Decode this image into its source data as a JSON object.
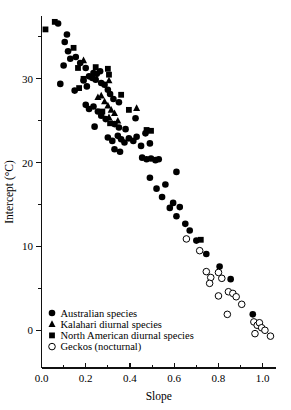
{
  "chart_data": {
    "type": "scatter",
    "title": "",
    "xlabel": "Slope",
    "ylabel": "Intercept (°C)",
    "xlim": [
      0.0,
      1.06
    ],
    "ylim": [
      -4.5,
      37.5
    ],
    "grid": false,
    "legend_position": "lower-left-inside",
    "x_ticks_major": [
      0.0,
      0.2,
      0.4,
      0.6,
      0.8,
      1.0
    ],
    "x_tick_labels": [
      "0.0",
      "0.2",
      "0.4",
      "0.6",
      "0.8",
      "1.0"
    ],
    "x_ticks_minor": [
      0.1,
      0.3,
      0.5,
      0.7,
      0.9
    ],
    "y_ticks_major": [
      0,
      10,
      20,
      30
    ],
    "y_tick_labels": [
      "0",
      "10",
      "20",
      "30"
    ],
    "y_ticks_minor": [
      5,
      15,
      25,
      35
    ],
    "series": [
      {
        "name": "Australian species",
        "marker": "filled-circle",
        "color": "#000000",
        "points": [
          [
            0.075,
            36.6
          ],
          [
            0.115,
            35.3
          ],
          [
            0.105,
            34.4
          ],
          [
            0.12,
            33.3
          ],
          [
            0.13,
            32.4
          ],
          [
            0.1,
            31.6
          ],
          [
            0.155,
            32.6
          ],
          [
            0.175,
            31.9
          ],
          [
            0.2,
            31.3
          ],
          [
            0.085,
            29.4
          ],
          [
            0.215,
            30.3
          ],
          [
            0.23,
            30.1
          ],
          [
            0.245,
            29.9
          ],
          [
            0.25,
            30.6
          ],
          [
            0.27,
            29.5
          ],
          [
            0.285,
            29.3
          ],
          [
            0.15,
            28.6
          ],
          [
            0.3,
            28.7
          ],
          [
            0.265,
            30.9
          ],
          [
            0.235,
            30.7
          ],
          [
            0.205,
            29.1
          ],
          [
            0.19,
            29.8
          ],
          [
            0.31,
            28.2
          ],
          [
            0.325,
            27.6
          ],
          [
            0.2,
            26.9
          ],
          [
            0.215,
            26.4
          ],
          [
            0.235,
            26.7
          ],
          [
            0.255,
            26.1
          ],
          [
            0.27,
            25.6
          ],
          [
            0.29,
            25.2
          ],
          [
            0.24,
            24.3
          ],
          [
            0.33,
            24.6
          ],
          [
            0.35,
            24.2
          ],
          [
            0.38,
            24.0
          ],
          [
            0.3,
            23.0
          ],
          [
            0.32,
            22.6
          ],
          [
            0.345,
            23.2
          ],
          [
            0.36,
            22.8
          ],
          [
            0.375,
            22.4
          ],
          [
            0.395,
            22.9
          ],
          [
            0.415,
            22.6
          ],
          [
            0.43,
            23.1
          ],
          [
            0.45,
            22.0
          ],
          [
            0.47,
            23.5
          ],
          [
            0.49,
            22.3
          ],
          [
            0.33,
            21.6
          ],
          [
            0.355,
            21.3
          ],
          [
            0.455,
            20.6
          ],
          [
            0.475,
            20.4
          ],
          [
            0.495,
            20.5
          ],
          [
            0.515,
            20.3
          ],
          [
            0.53,
            20.4
          ],
          [
            0.49,
            18.2
          ],
          [
            0.52,
            16.9
          ],
          [
            0.545,
            15.9
          ],
          [
            0.56,
            17.4
          ],
          [
            0.58,
            14.6
          ],
          [
            0.595,
            15.2
          ],
          [
            0.61,
            13.6
          ],
          [
            0.625,
            14.7
          ],
          [
            0.65,
            12.7
          ],
          [
            0.67,
            11.9
          ],
          [
            0.7,
            10.7
          ],
          [
            0.745,
            9.1
          ],
          [
            0.805,
            7.6
          ],
          [
            0.855,
            6.1
          ],
          [
            0.955,
            1.9
          ],
          [
            0.35,
            27.2
          ],
          [
            0.425,
            25.3
          ],
          [
            0.61,
            18.9
          ]
        ]
      },
      {
        "name": "Kalahari diurnal species",
        "marker": "filled-triangle",
        "color": "#000000",
        "points": [
          [
            0.19,
            32.2
          ],
          [
            0.305,
            29.8
          ],
          [
            0.285,
            27.3
          ],
          [
            0.3,
            26.8
          ],
          [
            0.315,
            26.3
          ],
          [
            0.305,
            25.4
          ],
          [
            0.33,
            25.9
          ],
          [
            0.345,
            25.0
          ],
          [
            0.43,
            26.5
          ],
          [
            0.27,
            28.0
          ],
          [
            0.255,
            27.8
          ]
        ]
      },
      {
        "name": "North American diurnal species",
        "marker": "filled-square",
        "color": "#000000",
        "points": [
          [
            0.06,
            36.8
          ],
          [
            0.018,
            35.9
          ],
          [
            0.145,
            33.7
          ],
          [
            0.165,
            31.3
          ],
          [
            0.245,
            31.4
          ],
          [
            0.3,
            31.2
          ],
          [
            0.305,
            30.5
          ],
          [
            0.19,
            30.0
          ],
          [
            0.36,
            28.1
          ],
          [
            0.275,
            26.1
          ],
          [
            0.395,
            26.3
          ],
          [
            0.31,
            24.7
          ],
          [
            0.475,
            23.9
          ],
          [
            0.495,
            23.8
          ],
          [
            0.72,
            10.8
          ],
          [
            0.17,
            28.9
          ]
        ]
      },
      {
        "name": "Geckos (nocturnal)",
        "marker": "open-circle",
        "color": "#000000",
        "points": [
          [
            0.655,
            10.9
          ],
          [
            0.715,
            9.5
          ],
          [
            0.745,
            7.0
          ],
          [
            0.765,
            6.3
          ],
          [
            0.76,
            5.6
          ],
          [
            0.8,
            6.9
          ],
          [
            0.815,
            6.2
          ],
          [
            0.8,
            4.1
          ],
          [
            0.845,
            4.6
          ],
          [
            0.865,
            4.4
          ],
          [
            0.88,
            4.0
          ],
          [
            0.905,
            3.1
          ],
          [
            0.84,
            1.9
          ],
          [
            0.96,
            1.0
          ],
          [
            0.975,
            0.6
          ],
          [
            0.985,
            0.9
          ],
          [
            0.965,
            -0.4
          ],
          [
            0.995,
            0.3
          ],
          [
            1.01,
            0.0
          ],
          [
            1.035,
            -0.7
          ]
        ]
      }
    ]
  }
}
